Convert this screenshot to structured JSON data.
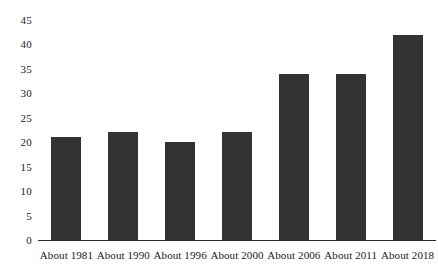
{
  "chart_data": {
    "type": "bar",
    "title": "",
    "subtitle": "",
    "xlabel": "",
    "ylabel": "",
    "categories": [
      "About 1981",
      "About 1990",
      "About 1996",
      "About 2000",
      "About 2006",
      "About 2011",
      "About 2018"
    ],
    "values": [
      21,
      22,
      20,
      22,
      34,
      34,
      42
    ],
    "ylim": [
      0,
      45
    ],
    "ytick_labels": [
      "0",
      "5",
      "10",
      "15",
      "20",
      "25",
      "30",
      "35",
      "40",
      "45"
    ],
    "ytick_values": [
      0,
      5,
      10,
      15,
      20,
      25,
      30,
      35,
      40,
      45
    ],
    "grid": false,
    "legend": null,
    "legend_position": "none",
    "annotations": [],
    "bar_color": "#333333",
    "axis_color": "#2b2b2b",
    "background_color": "#ffffff"
  }
}
